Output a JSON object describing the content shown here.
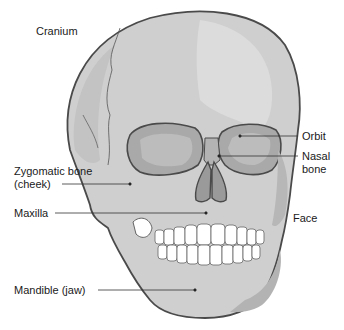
{
  "diagram": {
    "colors": {
      "bone": "#cfcfcf",
      "bone_light": "#dedede",
      "bone_shadow": "#b3b3b3",
      "cavity": "#a9a9a9",
      "outline": "#4a4a4a",
      "teeth": "#ffffff",
      "label_text": "#1a1a1a",
      "leader_line": "#333333"
    },
    "labels": {
      "cranium": "Cranium",
      "orbit": "Orbit",
      "nasal_line1": "Nasal",
      "nasal_line2": "bone",
      "zygomatic_line1": "Zygomatic bone",
      "zygomatic_line2": "(cheek)",
      "maxilla": "Maxilla",
      "face": "Face",
      "mandible": "Mandible (jaw)"
    }
  }
}
